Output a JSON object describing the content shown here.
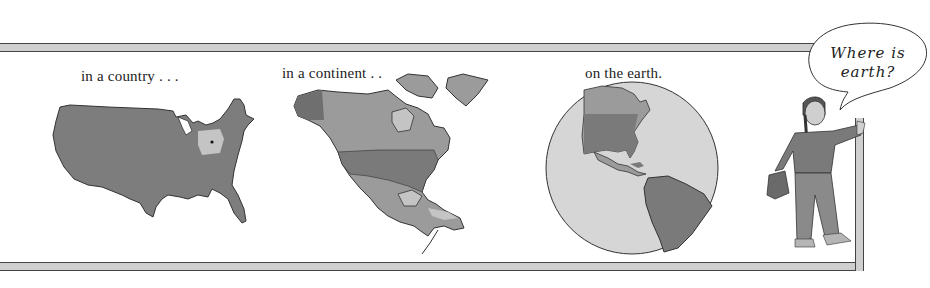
{
  "panels": [
    {
      "id": "country",
      "caption": "in a country . . .",
      "map": "usa-map"
    },
    {
      "id": "continent",
      "caption": "in a continent . .",
      "map": "north-america-map"
    },
    {
      "id": "earth",
      "caption": "on the earth.",
      "map": "globe-americas"
    }
  ],
  "speech_bubble": {
    "line1": "Where is",
    "line2": "earth?"
  },
  "colors": {
    "band_fill": "#cfcfcf",
    "land_dark": "#7a7a7a",
    "land_mid": "#9b9b9b",
    "land_light": "#c4c4c4",
    "ocean": "#d6d6d6",
    "outline": "#333333"
  }
}
